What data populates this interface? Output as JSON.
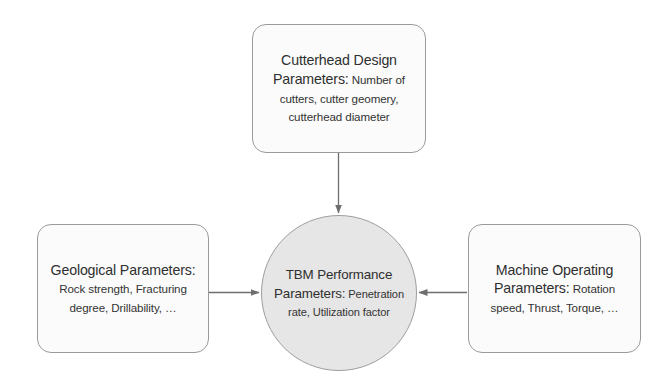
{
  "diagram": {
    "background_color": "#ffffff",
    "nodes": {
      "cutterhead": {
        "name": "Cutterhead Design Parameters",
        "title": "Cutterhead Design Parameters:",
        "body": " Number of cutters, cutter geomery, cutterhead diameter",
        "shape": "rounded-rectangle",
        "fill_color": "#fbfbfb",
        "border_color": "#9a9a9a"
      },
      "geological": {
        "name": "Geological Parameters",
        "title": "Geological Parameters:",
        "body": " Rock strength, Fracturing degree, Drillability, …",
        "shape": "rounded-rectangle",
        "fill_color": "#fbfbfb",
        "border_color": "#9a9a9a"
      },
      "machine": {
        "name": "Machine Operating Parameters",
        "title": "Machine Operating Parameters:",
        "body": " Rotation speed, Thrust, Torque, …",
        "shape": "rounded-rectangle",
        "fill_color": "#fbfbfb",
        "border_color": "#9a9a9a"
      },
      "tbm": {
        "name": "TBM Performance Parameters",
        "title": "TBM Performance Parameters:",
        "body": " Penetration rate, Utilization factor",
        "shape": "ellipse",
        "fill_color": "#e6e6e6",
        "border_color": "#9d9d9d"
      }
    },
    "edges": [
      {
        "name": "cutterhead-to-tbm",
        "from": "cutterhead",
        "to": "tbm",
        "direction": "down",
        "arrowhead": "end",
        "color": "#6e6e6e"
      },
      {
        "name": "geological-to-tbm",
        "from": "geological",
        "to": "tbm",
        "direction": "right",
        "arrowhead": "end",
        "color": "#6e6e6e"
      },
      {
        "name": "machine-to-tbm",
        "from": "machine",
        "to": "tbm",
        "direction": "left",
        "arrowhead": "end",
        "color": "#6e6e6e"
      }
    ]
  }
}
